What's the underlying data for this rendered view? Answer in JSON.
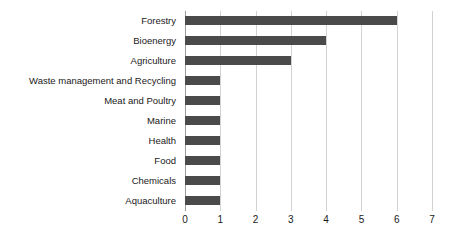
{
  "chart_data": {
    "type": "bar",
    "orientation": "horizontal",
    "title": "",
    "subtitle": "",
    "xlabel": "",
    "ylabel": "",
    "xlim": [
      0,
      7
    ],
    "xticks": [
      "0",
      "1",
      "2",
      "3",
      "4",
      "5",
      "6",
      "7"
    ],
    "grid": "vertical",
    "legend": "none",
    "categories": [
      "Forestry",
      "Bioenergy",
      "Agriculture",
      "Waste management and Recycling",
      "Meat and Poultry",
      "Marine",
      "Health",
      "Food",
      "Chemicals",
      "Aquaculture"
    ],
    "values": [
      6,
      4,
      3,
      1,
      1,
      1,
      1,
      1,
      1,
      1
    ],
    "bar_color": "#4a4a4a",
    "gridline_color": "#d2d2d2",
    "axis_color": "#9a9a9a",
    "text_color": "#1a1a1a",
    "background_color": "#ffffff"
  }
}
